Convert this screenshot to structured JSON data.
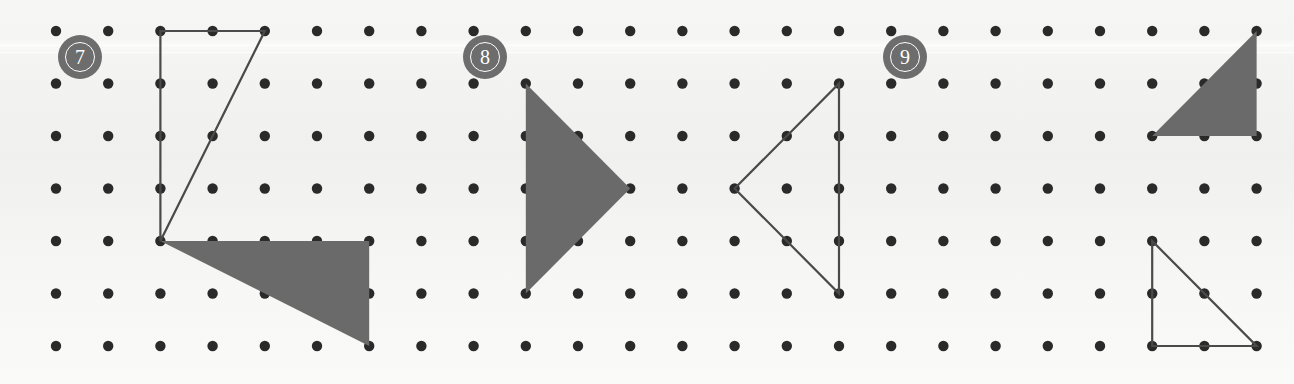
{
  "page": {
    "background_color": "#f2f2f0",
    "width": 1294,
    "height": 384
  },
  "grid": {
    "columns": 24,
    "rows": 7,
    "origin_x": 56,
    "origin_y": 31,
    "spacing_x": 52.2,
    "spacing_y": 52.5,
    "dot_radius": 5.2,
    "dot_color": "#2a2a2a"
  },
  "style": {
    "fill_color": "#6a6a6a",
    "outline_color": "#4a4a4a",
    "outline_width": 2.2,
    "badge_color": "#6d6d6d",
    "badge_text_color": "#ffffff"
  },
  "badges": [
    {
      "label": "7",
      "name": "problem-badge-7",
      "x": 58,
      "y": 35
    },
    {
      "label": "8",
      "name": "problem-badge-8",
      "x": 463,
      "y": 35
    },
    {
      "label": "9",
      "name": "problem-badge-9",
      "x": 883,
      "y": 35
    }
  ],
  "shapes": [
    {
      "name": "problem-7-outline-triangle",
      "problem": "7",
      "style": "outline",
      "grid_points": [
        [
          3,
          1
        ],
        [
          5,
          1
        ],
        [
          3,
          5
        ]
      ],
      "points": "212.6,31 317.0,31 212.6,241"
    },
    {
      "name": "problem-7-filled-triangle",
      "problem": "7",
      "style": "filled",
      "grid_points": [
        [
          3,
          5
        ],
        [
          7,
          5
        ],
        [
          7,
          7
        ]
      ],
      "points": "212.6,241 421.4,241 421.4,346"
    },
    {
      "name": "problem-8-filled-triangle",
      "problem": "8",
      "style": "filled",
      "grid_points": [
        [
          10,
          2
        ],
        [
          12,
          4
        ],
        [
          10,
          6
        ]
      ],
      "points": "578.0,83.5 682.4,188.5 578.0,293.5"
    },
    {
      "name": "problem-8-outline-triangle",
      "problem": "8",
      "style": "outline",
      "grid_points": [
        [
          14,
          4
        ],
        [
          16,
          2
        ],
        [
          16,
          6
        ]
      ],
      "points": "786.8,188.5 891.2,83.5 891.2,293.5"
    },
    {
      "name": "problem-9-filled-triangle",
      "problem": "9",
      "style": "filled",
      "grid_points": [
        [
          22,
          3
        ],
        [
          24,
          1
        ],
        [
          24,
          3
        ]
      ],
      "points": "1202.6,136 1307.0,31 1307.0,136"
    },
    {
      "name": "problem-9-outline-triangle",
      "problem": "9",
      "style": "outline",
      "grid_points": [
        [
          22,
          5
        ],
        [
          22,
          7
        ],
        [
          24,
          7
        ]
      ],
      "points": "1202.6,241 1202.6,346 1307.0,346"
    }
  ]
}
